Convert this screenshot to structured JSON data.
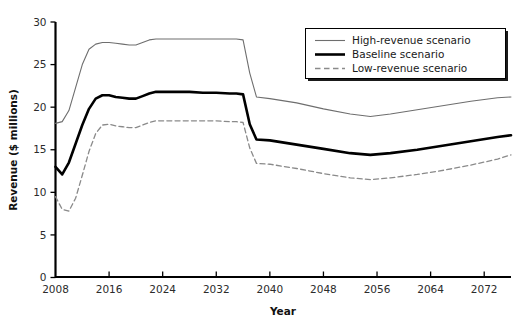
{
  "chart_data": {
    "type": "line",
    "title": "",
    "xlabel": "Year",
    "ylabel": "Revenue ($ millions)",
    "xlim": [
      2008,
      2076
    ],
    "ylim": [
      0,
      30
    ],
    "xticks": [
      2008,
      2016,
      2024,
      2032,
      2040,
      2048,
      2056,
      2064,
      2072
    ],
    "yticks": [
      0,
      5,
      10,
      15,
      20,
      25,
      30
    ],
    "grid": false,
    "legend_position": "top-right",
    "legend_entries": [
      {
        "label": "High-revenue scenario",
        "style": "thin-solid"
      },
      {
        "label": "Baseline scenario",
        "style": "thick-solid"
      },
      {
        "label": "Low-revenue scenario",
        "style": "dashed"
      }
    ],
    "x": [
      2008,
      2009,
      2010,
      2011,
      2012,
      2013,
      2014,
      2015,
      2016,
      2017,
      2018,
      2019,
      2020,
      2021,
      2022,
      2023,
      2024,
      2026,
      2028,
      2030,
      2032,
      2034,
      2035,
      2036,
      2037,
      2038,
      2040,
      2044,
      2048,
      2052,
      2055,
      2058,
      2062,
      2066,
      2070,
      2074,
      2076
    ],
    "series": [
      {
        "name": "High-revenue scenario",
        "values": [
          18.1,
          18.3,
          19.6,
          22.3,
          25.0,
          26.8,
          27.4,
          27.6,
          27.6,
          27.5,
          27.4,
          27.3,
          27.3,
          27.6,
          27.9,
          28.0,
          28.0,
          28.0,
          28.0,
          28.0,
          28.0,
          28.0,
          28.0,
          27.9,
          24.0,
          21.2,
          21.0,
          20.5,
          19.8,
          19.2,
          18.9,
          19.2,
          19.7,
          20.2,
          20.7,
          21.1,
          21.2
        ]
      },
      {
        "name": "Baseline scenario",
        "values": [
          13.0,
          12.1,
          13.5,
          15.7,
          17.9,
          19.8,
          21.0,
          21.4,
          21.4,
          21.2,
          21.1,
          21.0,
          21.0,
          21.3,
          21.6,
          21.8,
          21.8,
          21.8,
          21.8,
          21.7,
          21.7,
          21.6,
          21.6,
          21.5,
          18.0,
          16.2,
          16.1,
          15.6,
          15.1,
          14.6,
          14.4,
          14.6,
          15.0,
          15.5,
          16.0,
          16.5,
          16.7
        ]
      },
      {
        "name": "Low-revenue scenario",
        "values": [
          9.5,
          8.0,
          7.8,
          9.3,
          12.0,
          14.8,
          16.9,
          17.9,
          18.0,
          17.8,
          17.7,
          17.6,
          17.6,
          17.9,
          18.2,
          18.4,
          18.4,
          18.4,
          18.4,
          18.4,
          18.4,
          18.3,
          18.3,
          18.2,
          15.2,
          13.4,
          13.3,
          12.8,
          12.2,
          11.7,
          11.5,
          11.7,
          12.1,
          12.6,
          13.2,
          13.9,
          14.4
        ]
      }
    ],
    "colors": {
      "high": "#6e6e6e",
      "baseline": "#000000",
      "low": "#8a8a8a",
      "axis": "#000000",
      "background": "#ffffff"
    }
  }
}
